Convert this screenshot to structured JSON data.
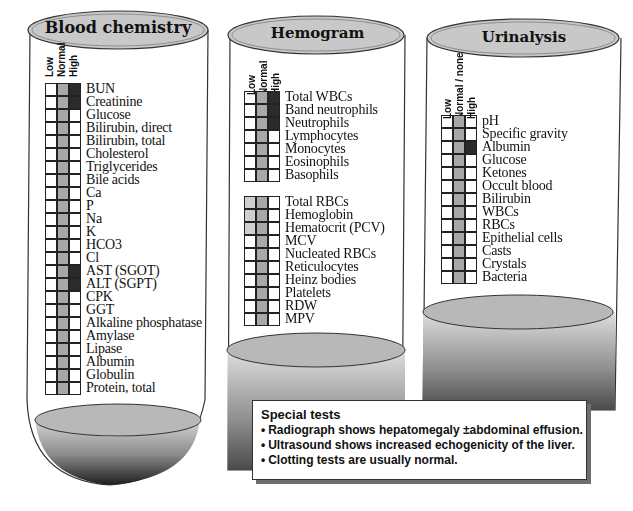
{
  "tubes": [
    {
      "title": "Blood chemistry",
      "columns": [
        "Low",
        "Normal",
        "High"
      ],
      "rows": [
        {
          "label": "BUN",
          "state": "high"
        },
        {
          "label": "Creatinine",
          "state": "high"
        },
        {
          "label": "Glucose",
          "state": "normal"
        },
        {
          "label": "Bilirubin, direct",
          "state": "normal"
        },
        {
          "label": "Bilirubin, total",
          "state": "normal"
        },
        {
          "label": "Cholesterol",
          "state": "normal"
        },
        {
          "label": "Triglycerides",
          "state": "normal"
        },
        {
          "label": "Bile acids",
          "state": "normal"
        },
        {
          "label": "Ca",
          "state": "normal"
        },
        {
          "label": "P",
          "state": "normal"
        },
        {
          "label": "Na",
          "state": "normal"
        },
        {
          "label": "K",
          "state": "normal"
        },
        {
          "label": "HCO3",
          "state": "normal"
        },
        {
          "label": "Cl",
          "state": "normal"
        },
        {
          "label": "AST (SGOT)",
          "state": "high"
        },
        {
          "label": "ALT (SGPT)",
          "state": "high"
        },
        {
          "label": "CPK",
          "state": "normal"
        },
        {
          "label": "GGT",
          "state": "normal"
        },
        {
          "label": "Alkaline phosphatase",
          "state": "normal"
        },
        {
          "label": "Amylase",
          "state": "normal"
        },
        {
          "label": "Lipase",
          "state": "normal"
        },
        {
          "label": "Albumin",
          "state": "normal"
        },
        {
          "label": "Globulin",
          "state": "normal"
        },
        {
          "label": "Protein, total",
          "state": "normal"
        }
      ]
    },
    {
      "title": "Hemogram",
      "columns": [
        "Low",
        "Normal",
        "High"
      ],
      "groups": [
        [
          {
            "label": "Total WBCs",
            "state": "high"
          },
          {
            "label": "Band neutrophils",
            "state": "high"
          },
          {
            "label": "Neutrophils",
            "state": "high"
          },
          {
            "label": "Lymphocytes",
            "state": "normal"
          },
          {
            "label": "Monocytes",
            "state": "normal"
          },
          {
            "label": "Eosinophils",
            "state": "normal"
          },
          {
            "label": "Basophils",
            "state": "normal"
          }
        ],
        [
          {
            "label": "Total RBCs",
            "state": "low-light"
          },
          {
            "label": "Hemoglobin",
            "state": "low-light"
          },
          {
            "label": "Hematocrit (PCV)",
            "state": "low-light"
          },
          {
            "label": "MCV",
            "state": "normal"
          },
          {
            "label": "Nucleated RBCs",
            "state": "normal"
          },
          {
            "label": "Reticulocytes",
            "state": "normal"
          },
          {
            "label": "Heinz bodies",
            "state": "normal"
          },
          {
            "label": "Platelets",
            "state": "normal"
          },
          {
            "label": "RDW",
            "state": "normal"
          },
          {
            "label": "MPV",
            "state": "normal"
          }
        ]
      ]
    },
    {
      "title": "Urinalysis",
      "columns": [
        "Low",
        "Normal / none",
        "High"
      ],
      "rows": [
        {
          "label": "pH",
          "state": "normal"
        },
        {
          "label": "Specific gravity",
          "state": "normal"
        },
        {
          "label": "Albumin",
          "state": "high"
        },
        {
          "label": "Glucose",
          "state": "normal"
        },
        {
          "label": "Ketones",
          "state": "normal"
        },
        {
          "label": "Occult blood",
          "state": "normal"
        },
        {
          "label": "Bilirubin",
          "state": "normal"
        },
        {
          "label": "WBCs",
          "state": "normal"
        },
        {
          "label": "RBCs",
          "state": "normal"
        },
        {
          "label": "Epithelial cells",
          "state": "normal"
        },
        {
          "label": "Casts",
          "state": "normal"
        },
        {
          "label": "Crystals",
          "state": "normal"
        },
        {
          "label": "Bacteria",
          "state": "normal"
        }
      ]
    }
  ],
  "special_tests": {
    "title": "Special tests",
    "bullet_glyph": "•",
    "items": [
      "Radiograph shows hepatomegaly ±abdominal effusion.",
      "Ultrasound shows increased echogenicity of the liver.",
      "Clotting tests are usually normal."
    ]
  },
  "colors": {
    "normal_fill": "#a8a8a8",
    "high_fill": "#2b2b2b",
    "low_light_fill": "#cfcfcf",
    "cap_fill": "#c8c8c8"
  }
}
